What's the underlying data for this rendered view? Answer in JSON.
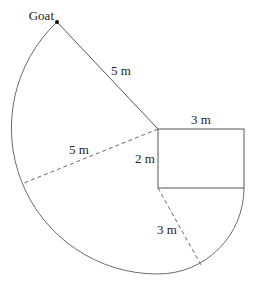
{
  "diagram": {
    "type": "geometry",
    "labels": {
      "goat": "Goat",
      "rope_length": "5 m",
      "radius_left": "5 m",
      "barn_width": "3 m",
      "barn_height": "2 m",
      "small_radius": "3 m"
    },
    "colors": {
      "line": "#555555",
      "text": "#222222",
      "background": "#ffffff"
    }
  }
}
